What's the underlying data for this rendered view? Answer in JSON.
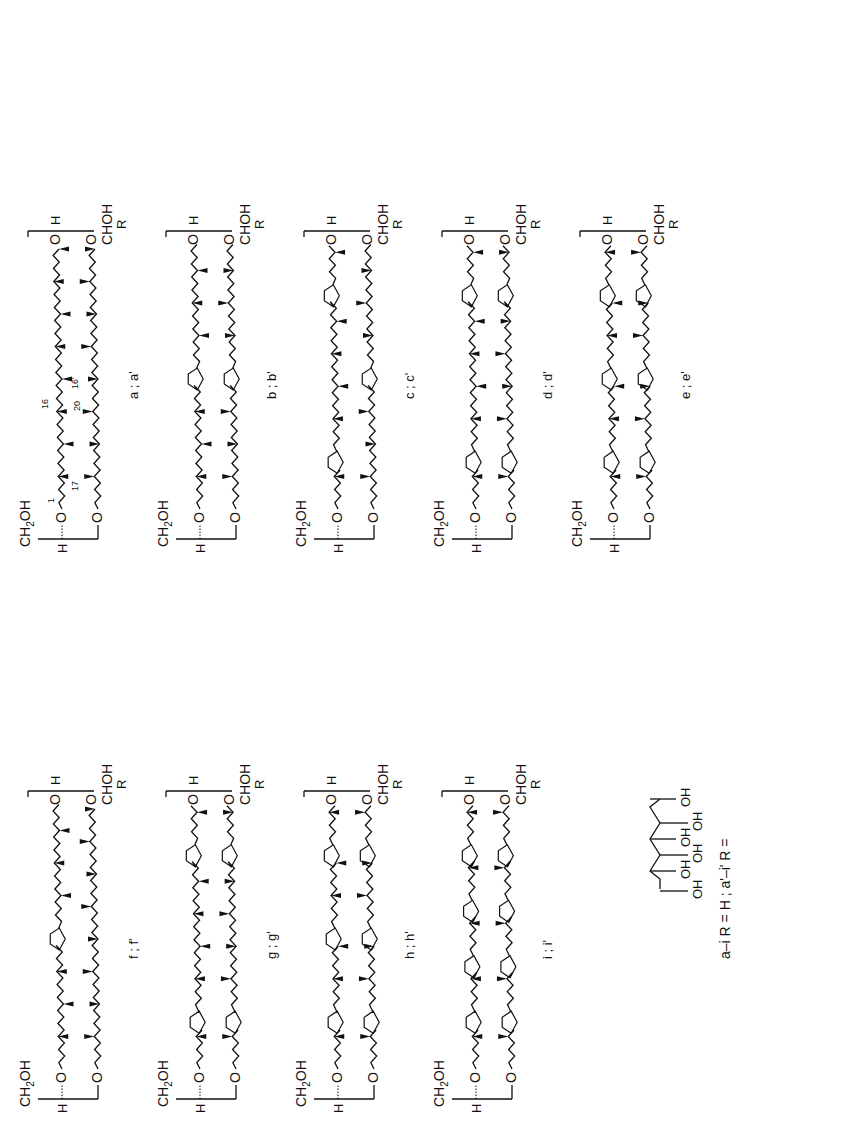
{
  "figure": {
    "orientation": "rotated-90-ccw",
    "structures": [
      {
        "id": "a",
        "label": "a ; a'",
        "column": 1,
        "row": 1,
        "chain1_rings": 0,
        "chain2_rings": 0,
        "numbering": [
          "1",
          "17",
          "20",
          "16",
          "16'"
        ]
      },
      {
        "id": "b",
        "label": "b ; b'",
        "column": 1,
        "row": 2,
        "chain1_rings": 1,
        "chain2_rings": 1
      },
      {
        "id": "c",
        "label": "c ; c'",
        "column": 1,
        "row": 3,
        "chain1_rings": 2,
        "chain2_rings": 1
      },
      {
        "id": "d",
        "label": "d ; d'",
        "column": 1,
        "row": 4,
        "chain1_rings": 2,
        "chain2_rings": 2
      },
      {
        "id": "e",
        "label": "e ; e'",
        "column": 1,
        "row": 5,
        "chain1_rings": 3,
        "chain2_rings": 3
      },
      {
        "id": "f",
        "label": "f ; f'",
        "column": 2,
        "row": 1,
        "chain1_rings": 1,
        "chain2_rings": 0
      },
      {
        "id": "g",
        "label": "g ; g'",
        "column": 2,
        "row": 2,
        "chain1_rings": 2,
        "chain2_rings": 2
      },
      {
        "id": "h",
        "label": "h ; h'",
        "column": 2,
        "row": 3,
        "chain1_rings": 3,
        "chain2_rings": 3
      },
      {
        "id": "i",
        "label": "i ; i'",
        "column": 2,
        "row": 4,
        "chain1_rings": 4,
        "chain2_rings": 4
      }
    ],
    "headgroup_left": {
      "top": "CH2OH",
      "h": "H",
      "o": "O"
    },
    "headgroup_right": {
      "bottom": "CHOH",
      "r": "R",
      "h": "H",
      "o": "O"
    },
    "numbering": {
      "n1": "1",
      "n17": "17",
      "n20": "20",
      "n16": "16",
      "n16p": "16'"
    },
    "legend": {
      "text": "a–i  R = H  ;  a'–i'  R =",
      "part1": "a–i",
      "part2": "R = H",
      "sep": ";",
      "part3": "a'–i'",
      "part4": "R =",
      "substituent_labels": [
        "OH",
        "OH",
        "OH",
        "OH",
        "OH",
        "OH"
      ]
    }
  },
  "colors": {
    "ink": "#111111",
    "background": "#ffffff"
  }
}
